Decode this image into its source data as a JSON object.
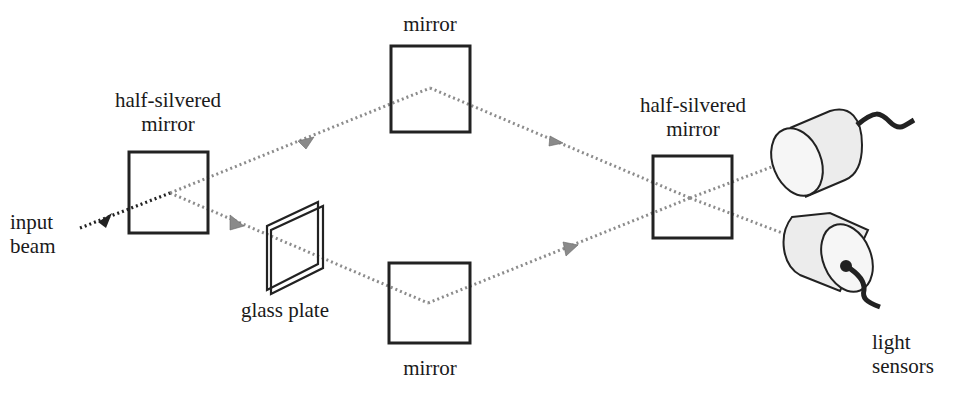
{
  "diagram": {
    "type": "interferometer",
    "labels": {
      "left_splitter": [
        "half-silvered",
        "mirror"
      ],
      "input": [
        "input",
        "beam"
      ],
      "glass_plate": "glass plate",
      "top_mirror": "mirror",
      "bottom_mirror": "mirror",
      "right_splitter": [
        "half-silvered",
        "mirror"
      ],
      "sensors": [
        "light",
        "sensors"
      ]
    },
    "colors": {
      "beam": "#8c8c8c",
      "input_beam": "#222222",
      "arrow": "#8a8a8a",
      "outline": "#222222",
      "sensor_fill": "#f0f0f0"
    }
  }
}
